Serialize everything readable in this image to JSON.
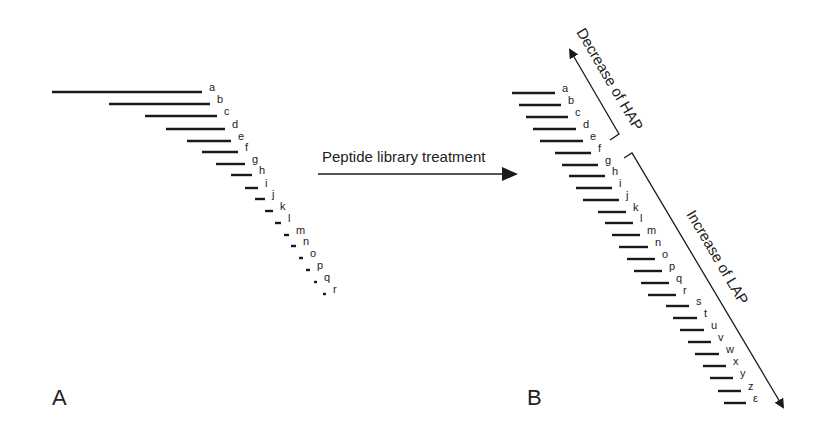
{
  "panel_a": {
    "label": "A",
    "bands": [
      {
        "id": "a",
        "x1": 52,
        "x2": 202,
        "y": 92
      },
      {
        "id": "b",
        "x1": 109,
        "x2": 210,
        "y": 104
      },
      {
        "id": "c",
        "x1": 145,
        "x2": 217,
        "y": 116
      },
      {
        "id": "d",
        "x1": 166,
        "x2": 225,
        "y": 129
      },
      {
        "id": "e",
        "x1": 187,
        "x2": 231,
        "y": 141
      },
      {
        "id": "f",
        "x1": 202,
        "x2": 238,
        "y": 152
      },
      {
        "id": "g",
        "x1": 216,
        "x2": 245,
        "y": 164
      },
      {
        "id": "h",
        "x1": 231,
        "x2": 252,
        "y": 175
      },
      {
        "id": "i",
        "x1": 245,
        "x2": 258,
        "y": 188
      },
      {
        "id": "j",
        "x1": 255,
        "x2": 265,
        "y": 199
      },
      {
        "id": "k",
        "x1": 265,
        "x2": 273,
        "y": 211
      },
      {
        "id": "l",
        "x1": 275,
        "x2": 281,
        "y": 223
      },
      {
        "id": "m",
        "x1": 284,
        "x2": 289,
        "y": 235
      },
      {
        "id": "n",
        "x1": 291,
        "x2": 296,
        "y": 246
      },
      {
        "id": "o",
        "x1": 299,
        "x2": 303,
        "y": 258
      },
      {
        "id": "p",
        "x1": 306,
        "x2": 310,
        "y": 270
      },
      {
        "id": "q",
        "x1": 314,
        "x2": 317,
        "y": 282
      },
      {
        "id": "r",
        "x1": 323,
        "x2": 326,
        "y": 294
      }
    ]
  },
  "treatment_arrow": {
    "label": "Peptide library treatment"
  },
  "panel_b": {
    "label": "B",
    "bands": [
      {
        "id": "a",
        "x1": 512,
        "x2": 555,
        "y": 93
      },
      {
        "id": "b",
        "x1": 519,
        "x2": 561,
        "y": 105
      },
      {
        "id": "c",
        "x1": 526,
        "x2": 568,
        "y": 117
      },
      {
        "id": "d",
        "x1": 533,
        "x2": 576,
        "y": 129
      },
      {
        "id": "e",
        "x1": 540,
        "x2": 583,
        "y": 141
      },
      {
        "id": "f",
        "x1": 555,
        "x2": 591,
        "y": 153
      },
      {
        "id": "g",
        "x1": 562,
        "x2": 598,
        "y": 165
      },
      {
        "id": "h",
        "x1": 569,
        "x2": 605,
        "y": 176
      },
      {
        "id": "i",
        "x1": 576,
        "x2": 612,
        "y": 188
      },
      {
        "id": "j",
        "x1": 583,
        "x2": 619,
        "y": 200
      },
      {
        "id": "k",
        "x1": 598,
        "x2": 626,
        "y": 212
      },
      {
        "id": "l",
        "x1": 605,
        "x2": 633,
        "y": 223
      },
      {
        "id": "m",
        "x1": 612,
        "x2": 640,
        "y": 235
      },
      {
        "id": "n",
        "x1": 619,
        "x2": 648,
        "y": 247
      },
      {
        "id": "o",
        "x1": 627,
        "x2": 655,
        "y": 259
      },
      {
        "id": "p",
        "x1": 634,
        "x2": 662,
        "y": 271
      },
      {
        "id": "q",
        "x1": 641,
        "x2": 669,
        "y": 283
      },
      {
        "id": "r",
        "x1": 648,
        "x2": 676,
        "y": 295
      },
      {
        "id": "s",
        "x1": 666,
        "x2": 689,
        "y": 306
      },
      {
        "id": "t",
        "x1": 673,
        "x2": 697,
        "y": 318
      },
      {
        "id": "u",
        "x1": 680,
        "x2": 704,
        "y": 330
      },
      {
        "id": "v",
        "x1": 688,
        "x2": 711,
        "y": 342
      },
      {
        "id": "w",
        "x1": 695,
        "x2": 719,
        "y": 354
      },
      {
        "id": "x",
        "x1": 703,
        "x2": 726,
        "y": 366
      },
      {
        "id": "y",
        "x1": 710,
        "x2": 733,
        "y": 378
      },
      {
        "id": "z",
        "x1": 718,
        "x2": 741,
        "y": 391
      },
      {
        "id": "ε",
        "x1": 724,
        "x2": 746,
        "y": 403
      }
    ],
    "hap_annotation": "Decrease of HAP",
    "lap_annotation": "Increase of LAP"
  },
  "colors": {
    "ink": "#1a1a1a",
    "background": "#ffffff"
  }
}
